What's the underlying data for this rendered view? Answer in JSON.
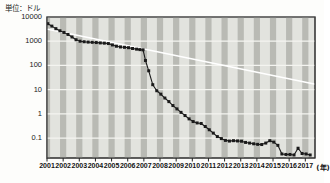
{
  "chart_data": {
    "type": "line",
    "title": "",
    "subtitle": "",
    "ylabel": "単位：ドル",
    "xlabel": "(年)",
    "yscale": "log",
    "ylim": [
      0.015,
      10000
    ],
    "xlim": [
      2001,
      2017.6
    ],
    "grid": true,
    "legend": null,
    "ytick_labels": [
      "10000",
      "1000",
      "100",
      "10",
      "1",
      "0.1"
    ],
    "ytick_values": [
      10000,
      1000,
      100,
      10,
      1,
      0.1
    ],
    "xtick_labels": [
      "2001",
      "2002",
      "2003",
      "2004",
      "2005",
      "2006",
      "2007",
      "2008",
      "2009",
      "2010",
      "2011",
      "2012",
      "2013",
      "2014",
      "2015",
      "2016",
      "2017"
    ],
    "xtick_values": [
      2001,
      2002,
      2003,
      2004,
      2005,
      2006,
      2007,
      2008,
      2009,
      2010,
      2011,
      2012,
      2013,
      2014,
      2015,
      2016,
      2017
    ],
    "series": [
      {
        "name": "cost",
        "marker": "square",
        "color": "#1a1a1a",
        "x": [
          2001.05,
          2001.3,
          2001.55,
          2001.8,
          2002.05,
          2002.3,
          2002.55,
          2002.8,
          2003.05,
          2003.3,
          2003.55,
          2003.8,
          2004.05,
          2004.3,
          2004.55,
          2004.8,
          2005.05,
          2005.3,
          2005.55,
          2005.8,
          2006.05,
          2006.3,
          2006.55,
          2006.75,
          2006.95,
          2007.1,
          2007.3,
          2007.55,
          2007.8,
          2008.05,
          2008.3,
          2008.55,
          2008.8,
          2009.05,
          2009.3,
          2009.55,
          2009.8,
          2010.05,
          2010.3,
          2010.55,
          2010.8,
          2011.05,
          2011.3,
          2011.55,
          2011.8,
          2012.05,
          2012.3,
          2012.55,
          2012.8,
          2013.05,
          2013.3,
          2013.55,
          2013.8,
          2014.05,
          2014.3,
          2014.55,
          2014.8,
          2015.05,
          2015.3,
          2015.55,
          2015.8,
          2016.05,
          2016.3,
          2016.55,
          2016.8,
          2017.05,
          2017.3
        ],
        "y": [
          5300,
          4200,
          3300,
          2700,
          2300,
          1900,
          1500,
          1150,
          1000,
          950,
          920,
          900,
          880,
          850,
          830,
          800,
          700,
          620,
          580,
          560,
          540,
          500,
          470,
          450,
          440,
          160,
          60,
          16,
          9,
          6.5,
          4.5,
          3.2,
          2.2,
          1.6,
          1.15,
          0.85,
          0.62,
          0.48,
          0.42,
          0.4,
          0.3,
          0.22,
          0.16,
          0.115,
          0.095,
          0.08,
          0.075,
          0.078,
          0.076,
          0.074,
          0.066,
          0.062,
          0.058,
          0.055,
          0.054,
          0.062,
          0.078,
          0.068,
          0.05,
          0.022,
          0.021,
          0.021,
          0.02,
          0.038,
          0.023,
          0.022,
          0.02
        ]
      }
    ],
    "annotations": [
      {
        "name": "trend-line",
        "type": "line",
        "color": "#ffffff",
        "x": [
          2001.05,
          2017.55
        ],
        "y": [
          3100,
          17
        ]
      }
    ]
  },
  "axes": {
    "unit_note": "単位：ドル",
    "x_unit_note": "(年)"
  }
}
